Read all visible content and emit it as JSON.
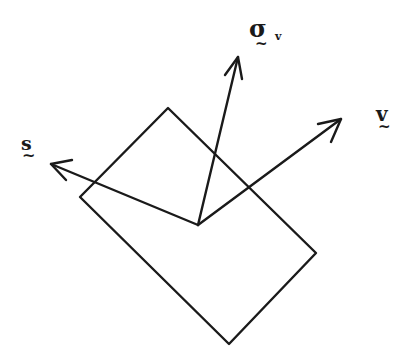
{
  "diagram": {
    "stroke_color": "#1a1a1a",
    "background": "#ffffff",
    "shape": {
      "type": "rectangle-rotated",
      "corners": [
        [
          168,
          108
        ],
        [
          316,
          253
        ],
        [
          229,
          344
        ],
        [
          80,
          197
        ]
      ]
    },
    "origin": [
      198,
      225
    ],
    "vectors": [
      {
        "name": "s",
        "tip": [
          51,
          164
        ]
      },
      {
        "name": "sigma_v",
        "tip": [
          238,
          57
        ]
      },
      {
        "name": "v",
        "tip": [
          341,
          119
        ]
      }
    ],
    "labels": {
      "s": {
        "text": "s",
        "tilde": "~"
      },
      "sigma_v": {
        "text": "σ",
        "subscript": "v",
        "tilde": "~"
      },
      "v": {
        "text": "v",
        "tilde": "~"
      }
    }
  }
}
